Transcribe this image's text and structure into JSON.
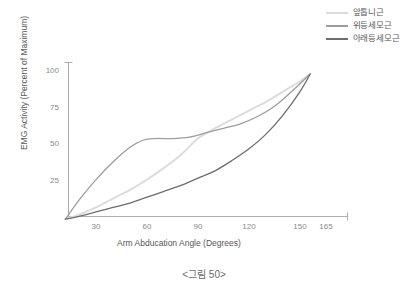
{
  "caption": "<그림 50>",
  "legend": {
    "position": "top-right",
    "items": [
      {
        "label": "앞톱니근",
        "color": "#dcdcdc",
        "width": 1.6
      },
      {
        "label": "위등세모근",
        "color": "#9d9d9f",
        "width": 1.5
      },
      {
        "label": "아래등세모근",
        "color": "#6d6d6f",
        "width": 1.5
      }
    ]
  },
  "axes": {
    "x_title": "Arm Abducation Angle (Degrees)",
    "y_title": "EMG Activity (Percent of Maximum)",
    "x_ticks": [
      "30",
      "60",
      "90",
      "120",
      "150",
      "165"
    ],
    "y_ticks": [
      "100",
      "75",
      "50",
      "25"
    ]
  },
  "chart_data": {
    "type": "line",
    "title": "",
    "xlabel": "Arm Abducation Angle (Degrees)",
    "ylabel": "EMG Activity (Percent of Maximum)",
    "xlim": [
      10,
      165
    ],
    "ylim": [
      0,
      105
    ],
    "xticks": [
      30,
      60,
      90,
      120,
      150,
      165
    ],
    "yticks": [
      25,
      50,
      75,
      100
    ],
    "grid": false,
    "legend_position": "top-right",
    "series": [
      {
        "name": "앞톱니근",
        "color": "#dcdcdc",
        "x": [
          12,
          20,
          30,
          40,
          50,
          60,
          70,
          80,
          90,
          100,
          110,
          120,
          130,
          140,
          150,
          156
        ],
        "values": [
          1,
          4,
          9,
          15,
          21,
          28,
          36,
          45,
          56,
          63,
          69,
          75,
          81,
          88,
          95,
          100
        ]
      },
      {
        "name": "위등세모근",
        "color": "#9d9d9f",
        "x": [
          12,
          20,
          30,
          40,
          50,
          58,
          65,
          75,
          85,
          95,
          105,
          115,
          125,
          135,
          145,
          156
        ],
        "values": [
          1,
          14,
          28,
          40,
          50,
          55,
          56,
          56,
          57,
          60,
          63,
          66,
          71,
          78,
          88,
          100
        ]
      },
      {
        "name": "아래등세모근",
        "color": "#6d6d6f",
        "x": [
          12,
          20,
          30,
          40,
          50,
          60,
          70,
          80,
          90,
          100,
          110,
          120,
          130,
          140,
          150,
          156
        ],
        "values": [
          1,
          3,
          6,
          9,
          12,
          16,
          20,
          24,
          29,
          34,
          41,
          49,
          59,
          72,
          88,
          100
        ]
      }
    ]
  }
}
